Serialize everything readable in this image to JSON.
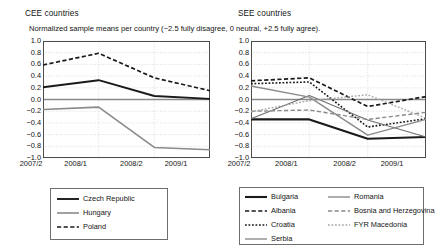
{
  "panels": {
    "cee": {
      "title": "CEE countries"
    },
    "see": {
      "title": "SEE countries"
    }
  },
  "subtitle": "Normalized sample means per country (−2.5 fully disagree, 0 neutral, +2.5 fully agree).",
  "axis": {
    "xticks": [
      "2007/2",
      "2008/1",
      "2008/2",
      "2009/1"
    ],
    "yticks": [
      "1.0",
      "0.8",
      "0.6",
      "0.4",
      "0.2",
      "0.0",
      "−0.2",
      "−0.4",
      "−0.6",
      "−0.8",
      "−1.0"
    ]
  },
  "colors": {
    "black": "#1a1a1a",
    "gray": "#8a8a8a",
    "grid": "#cfcfcf",
    "frame": "#4d4d4d",
    "zero": "#8a8a8a"
  },
  "chart_data": [
    {
      "type": "line",
      "title": "CEE countries",
      "subtitle": "Normalized sample means per country (−2.5 fully disagree, 0 neutral, +2.5 fully agree).",
      "xlabel": "",
      "ylabel": "",
      "x": [
        "2007/2",
        "2008/1",
        "2008/2",
        "2009/1"
      ],
      "ylim": [
        -1.0,
        1.0
      ],
      "yticks": [
        1.0,
        0.8,
        0.6,
        0.4,
        0.2,
        0.0,
        -0.2,
        -0.4,
        -0.6,
        -0.8,
        -1.0
      ],
      "grid": true,
      "legend_position": "below",
      "series": [
        {
          "name": "Czech Republic",
          "values": [
            0.21,
            0.33,
            0.06,
            0.01
          ],
          "color": "#1a1a1a",
          "style": "solid",
          "width": 1.9
        },
        {
          "name": "Hungary",
          "values": [
            -0.17,
            -0.13,
            -0.82,
            -0.86
          ],
          "color": "#8a8a8a",
          "style": "solid",
          "width": 1.6
        },
        {
          "name": "Poland",
          "values": [
            0.59,
            0.79,
            0.37,
            0.15
          ],
          "color": "#1a1a1a",
          "style": "dashed",
          "width": 1.7
        }
      ]
    },
    {
      "type": "line",
      "title": "SEE countries",
      "subtitle": "",
      "xlabel": "",
      "ylabel": "",
      "x": [
        "2007/2",
        "2008/1",
        "2008/2",
        "2009/1"
      ],
      "ylim": [
        -1.0,
        1.0
      ],
      "yticks": [
        1.0,
        0.8,
        0.6,
        0.4,
        0.2,
        0.0,
        -0.2,
        -0.4,
        -0.6,
        -0.8,
        -1.0
      ],
      "grid": true,
      "legend_position": "below",
      "series": [
        {
          "name": "Bulgaria",
          "values": [
            -0.34,
            -0.34,
            -0.67,
            -0.64
          ],
          "color": "#1a1a1a",
          "style": "solid",
          "width": 2.1
        },
        {
          "name": "Albania",
          "values": [
            0.32,
            0.37,
            -0.12,
            0.05
          ],
          "color": "#1a1a1a",
          "style": "dashed",
          "width": 1.7
        },
        {
          "name": "Croatia",
          "values": [
            0.27,
            0.3,
            -0.47,
            -0.33
          ],
          "color": "#1a1a1a",
          "style": "dotted",
          "width": 1.6
        },
        {
          "name": "Serbia",
          "values": [
            -0.33,
            0.07,
            -0.35,
            -0.64
          ],
          "color": "#6e6e6e",
          "style": "solid",
          "width": 1.1
        },
        {
          "name": "Romania",
          "values": [
            0.23,
            0.04,
            -0.61,
            -0.34
          ],
          "color": "#8a8a8a",
          "style": "solid",
          "width": 1.4
        },
        {
          "name": "Bosnia and Herzegovina",
          "values": [
            -0.2,
            -0.18,
            -0.34,
            -0.22
          ],
          "color": "#8a8a8a",
          "style": "dashed",
          "width": 1.4
        },
        {
          "name": "FYR Macedonia",
          "values": [
            -0.21,
            -0.02,
            0.08,
            -0.32
          ],
          "color": "#a8a8a8",
          "style": "dotted",
          "width": 1.4
        }
      ]
    }
  ],
  "legends": {
    "cee": [
      {
        "label": "Czech Republic",
        "color": "#1a1a1a",
        "style": "solid",
        "width": 1.9
      },
      {
        "label": "Hungary",
        "color": "#8a8a8a",
        "style": "solid",
        "width": 1.6
      },
      {
        "label": "Poland",
        "color": "#1a1a1a",
        "style": "dashed",
        "width": 1.7
      }
    ],
    "see_col1": [
      {
        "label": "Bulgaria",
        "color": "#1a1a1a",
        "style": "solid",
        "width": 2.1
      },
      {
        "label": "Albania",
        "color": "#1a1a1a",
        "style": "dashed",
        "width": 1.7
      },
      {
        "label": "Croatia",
        "color": "#1a1a1a",
        "style": "dotted",
        "width": 1.6
      },
      {
        "label": "Serbia",
        "color": "#6e6e6e",
        "style": "solid",
        "width": 1.1
      }
    ],
    "see_col2": [
      {
        "label": "Romania",
        "color": "#8a8a8a",
        "style": "solid",
        "width": 1.4
      },
      {
        "label": "Bosnia and Herzegovina",
        "color": "#8a8a8a",
        "style": "dashed",
        "width": 1.4
      },
      {
        "label": "FYR Macedonia",
        "color": "#a8a8a8",
        "style": "dotted",
        "width": 1.4
      }
    ]
  }
}
